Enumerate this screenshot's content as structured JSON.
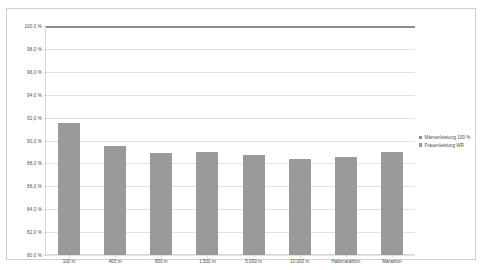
{
  "chart_data": {
    "type": "bar",
    "title": "",
    "xlabel": "",
    "ylabel": "",
    "ylim": [
      80.0,
      100.0
    ],
    "grid": true,
    "legend_position": "right",
    "categories": [
      "100 m",
      "400 m",
      "800 m",
      "1.500 m",
      "5.000 m",
      "10.000 m",
      "Halbmarathon",
      "Marathon"
    ],
    "ytick_labels": [
      "100,0 %",
      "98,0 %",
      "96,0 %",
      "94,0 %",
      "92,0 %",
      "90,0 %",
      "88,0 %",
      "86,0 %",
      "84,0 %",
      "82,0 %",
      "80,0 %"
    ],
    "ytick_values": [
      100.0,
      98.0,
      96.0,
      94.0,
      92.0,
      90.0,
      88.0,
      86.0,
      84.0,
      82.0,
      80.0
    ],
    "series": [
      {
        "name": "Männerleistung 100 %",
        "render": "reference_line",
        "color": "#8d8d8d",
        "value": 100.0,
        "values": [
          100.0,
          100.0,
          100.0,
          100.0,
          100.0,
          100.0,
          100.0,
          100.0
        ]
      },
      {
        "name": "Frauenleistung WR",
        "render": "bars",
        "color": "#9a9a9a",
        "values": [
          91.5,
          89.5,
          88.9,
          89.0,
          88.7,
          88.4,
          88.6,
          89.0
        ]
      }
    ]
  },
  "legend": {
    "items": [
      {
        "label": "Männerleistung 100 %",
        "color": "#8d8d8d"
      },
      {
        "label": "Frauenleistung WR",
        "color": "#9a9a9a"
      }
    ]
  },
  "colors": {
    "bar": "#9a9a9a",
    "reference_line": "#8d8d8d",
    "grid": "#e2e2e2",
    "frame": "#d0d0d0",
    "text": "#4d4d4d",
    "background": "#ffffff"
  }
}
